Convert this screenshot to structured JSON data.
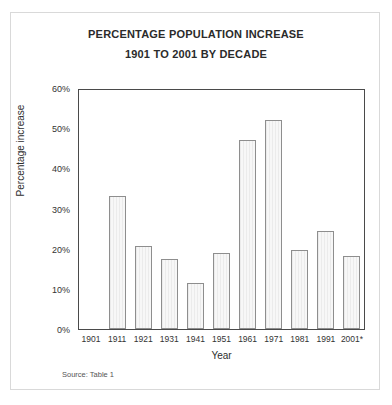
{
  "chart_data": {
    "type": "bar",
    "title": "PERCENTAGE POPULATION INCREASE",
    "subtitle": "1901 TO 2001 BY DECADE",
    "xlabel": "Year",
    "ylabel": "Percentage increase",
    "categories": [
      "1901",
      "1911",
      "1921",
      "1931",
      "1941",
      "1951",
      "1961",
      "1971",
      "1981",
      "1991",
      "2001*"
    ],
    "values": [
      0,
      33,
      20.7,
      17.5,
      11.5,
      19,
      47,
      52,
      19.7,
      24.5,
      18.2
    ],
    "ylim": [
      0,
      60
    ],
    "ytick_labels": [
      "0%",
      "10%",
      "20%",
      "30%",
      "40%",
      "50%",
      "60%"
    ],
    "ytick_values": [
      0,
      10,
      20,
      30,
      40,
      50,
      60
    ],
    "grid": false,
    "legend": "none",
    "annotations": [
      "Source: Table 1"
    ]
  },
  "footer": {
    "source": "Source: Table 1"
  },
  "colors": {
    "bar_fill": "#f1f1f1",
    "bar_stroke": "#8e8e8e",
    "axis": "#4a4a4a",
    "text": "#2b2b2b",
    "page_border": "#d9d9d9"
  }
}
